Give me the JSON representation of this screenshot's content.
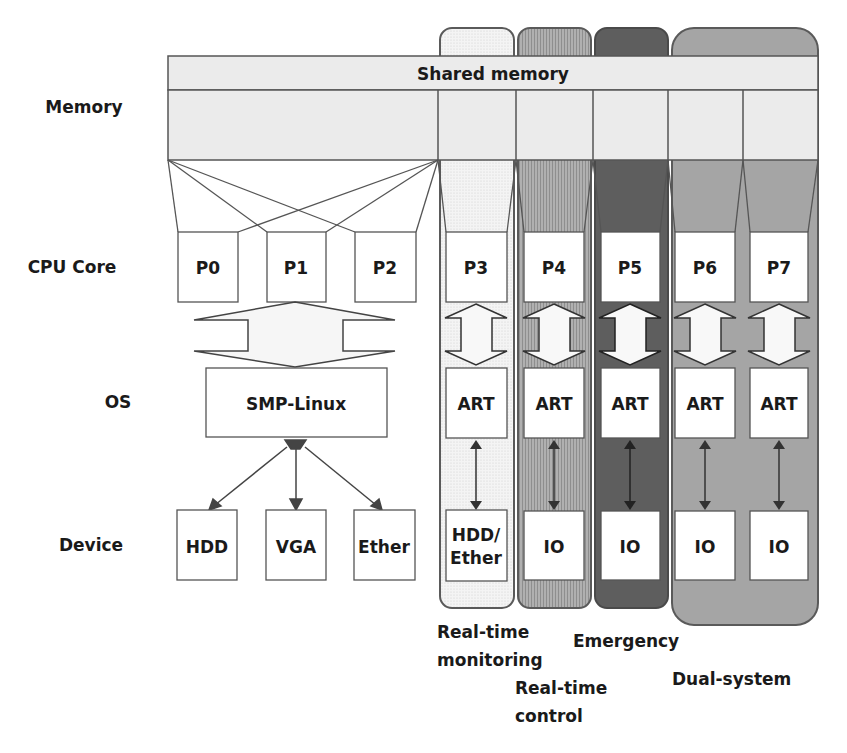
{
  "diagram": {
    "row_labels": {
      "memory": "Memory",
      "cpu": "CPU Core",
      "os": "OS",
      "device": "Device"
    },
    "shared_memory": {
      "title": "Shared memory"
    },
    "smp_cores": [
      "P0",
      "P1",
      "P2"
    ],
    "smp_os": "SMP-Linux",
    "smp_devices": [
      "HDD",
      "VGA",
      "Ether"
    ],
    "rt_cores": [
      "P3",
      "P4",
      "P5",
      "P6",
      "P7"
    ],
    "rt_os": [
      "ART",
      "ART",
      "ART",
      "ART",
      "ART"
    ],
    "rt_devices": [
      {
        "line1": "HDD/",
        "line2": "Ether"
      },
      {
        "line1": "IO"
      },
      {
        "line1": "IO"
      },
      {
        "line1": "IO"
      },
      {
        "line1": "IO"
      }
    ],
    "groups": [
      {
        "id": "realtime-monitoring",
        "line1": "Real-time",
        "line2": "monitoring",
        "color": "#f2f2f2"
      },
      {
        "id": "realtime-control",
        "line1": "Real-time",
        "line2": "control",
        "color": "#a8a8a8"
      },
      {
        "id": "emergency",
        "line1": "Emergency",
        "color": "#5e5e5e"
      },
      {
        "id": "dual-system",
        "line1": "Dual-system",
        "color": "#a3a3a3"
      }
    ],
    "colors": {
      "memory_fill": "#ebebeb",
      "stroke": "#555555",
      "box_fill": "#ffffff"
    }
  }
}
